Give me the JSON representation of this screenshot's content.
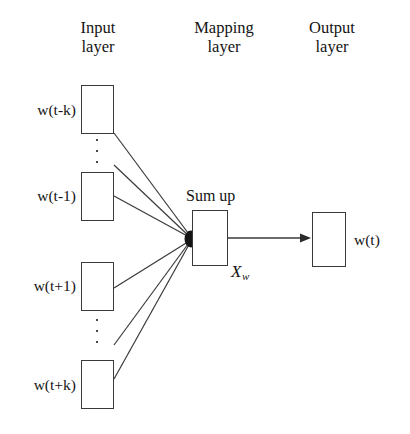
{
  "figure": {
    "type": "neural-network-architecture-diagram",
    "background_color": "#ffffff",
    "line_color": "#3a3a3a",
    "text_color": "#141414"
  },
  "headers": {
    "input": "Input\nlayer",
    "mapping": "Mapping\nlayer",
    "output": "Output\nlayer"
  },
  "input_layer": {
    "nodes": [
      {
        "label": "w(t-k)"
      },
      {
        "label": "w(t-1)"
      },
      {
        "label": "w(t+1)"
      },
      {
        "label": "w(t+k)"
      }
    ],
    "ellipsis_marks": 2
  },
  "mapping_layer": {
    "caption": "Sum up",
    "annotation_x": "X",
    "annotation_sub": "w"
  },
  "output_layer": {
    "label": "w(t)"
  }
}
